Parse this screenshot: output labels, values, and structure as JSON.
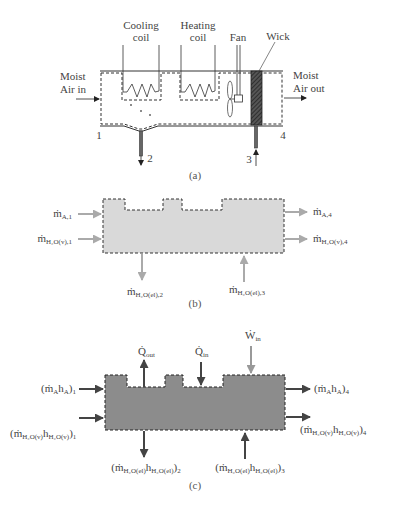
{
  "diagram_a": {
    "caption": "(a)",
    "cooling_coil": {
      "line1": "Cooling",
      "line2": "coil"
    },
    "heating_coil": {
      "line1": "Heating",
      "line2": "coil"
    },
    "fan": "Fan",
    "wick": "Wick",
    "inlet": {
      "line1": "Moist",
      "line2": "Air in"
    },
    "outlet": {
      "line1": "Moist",
      "line2": "Air out"
    },
    "state_labels": [
      "1",
      "2",
      "3",
      "4"
    ]
  },
  "diagram_b": {
    "caption": "(b)",
    "fill_color": "#d9d9d9",
    "arrow_color": "#aaaaaa",
    "flows": {
      "in_air_1": {
        "sym": "ṁ",
        "sub": "A,1"
      },
      "in_vapor_1": {
        "sym": "ṁ",
        "sub": "H₂O(v),1"
      },
      "out_air_4": {
        "sym": "ṁ",
        "sub": "A,4"
      },
      "out_vapor_4": {
        "sym": "ṁ",
        "sub": "H₂O(v),4"
      },
      "out_liquid_2": {
        "sym": "ṁ",
        "sub": "H₂O(el),2"
      },
      "in_liquid_3": {
        "sym": "ṁ",
        "sub": "H₂O(el),3"
      }
    }
  },
  "diagram_c": {
    "caption": "(c)",
    "fill_color": "#8c8c8c",
    "arrow_color": "#444444",
    "w_arrow_color": "#999999",
    "flows": {
      "in_air_1": {
        "pre": "(ṁ",
        "sub1": "A",
        "mid": "h",
        "sub2": "A",
        "post": ")",
        "state": "1"
      },
      "in_vapor_1": {
        "pre": "(ṁ",
        "sub1": "H₂O(v)",
        "mid": "h",
        "sub2": "H₂O(v)",
        "post": ")",
        "state": "1"
      },
      "out_air_4": {
        "pre": "(ṁ",
        "sub1": "A",
        "mid": "h",
        "sub2": "A",
        "post": ")",
        "state": "4"
      },
      "out_vapor_4": {
        "pre": "(ṁ",
        "sub1": "H₂O(v)",
        "mid": "h",
        "sub2": "H₂O(v)",
        "post": ")",
        "state": "4"
      },
      "out_liquid_2": {
        "pre": "(ṁ",
        "sub1": "H₂O(el)",
        "mid": "h",
        "sub2": "H₂O(el)",
        "post": ")",
        "state": "2"
      },
      "in_liquid_3": {
        "pre": "(ṁ",
        "sub1": "H₂O(el)",
        "mid": "h",
        "sub2": "H₂O(el)",
        "post": ")",
        "state": "3"
      },
      "q_out": {
        "sym": "Q̇",
        "sub": "out"
      },
      "q_in": {
        "sym": "Q̇",
        "sub": "in"
      },
      "w_in": {
        "sym": "Ẇ",
        "sub": "in"
      }
    }
  }
}
